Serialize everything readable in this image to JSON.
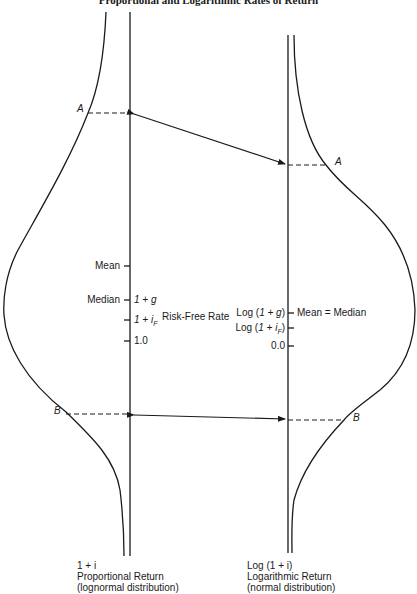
{
  "title": "Proportional and Logarithmic Rates of Return",
  "left_axis": {
    "markers": {
      "mean": "Mean",
      "median": "Median",
      "one_plus_g": "1 + g",
      "one_plus_if": "1 + i",
      "if_subscript": "F",
      "one": "1.0"
    },
    "point_a": "A",
    "point_b": "B",
    "caption": {
      "var": "1 + i",
      "line1": "Proportional Return",
      "line2": "(lognormal distribution)"
    }
  },
  "middle": {
    "risk_free": "Risk-Free Rate"
  },
  "right_axis": {
    "markers": {
      "log_one_plus_g": "Log (1 + g)",
      "mean_eq_median": "Mean = Median",
      "log_one_plus_if": "Log (1 + i",
      "if_subscript": "F",
      "log_close": ")",
      "zero": "0.0"
    },
    "point_a": "A",
    "point_b": "B",
    "caption": {
      "var": "Log (1 + i)",
      "line1": "Logarithmic Return",
      "line2": "(normal distribution)"
    }
  },
  "colors": {
    "line": "#1a1a1a",
    "background": "#ffffff"
  }
}
